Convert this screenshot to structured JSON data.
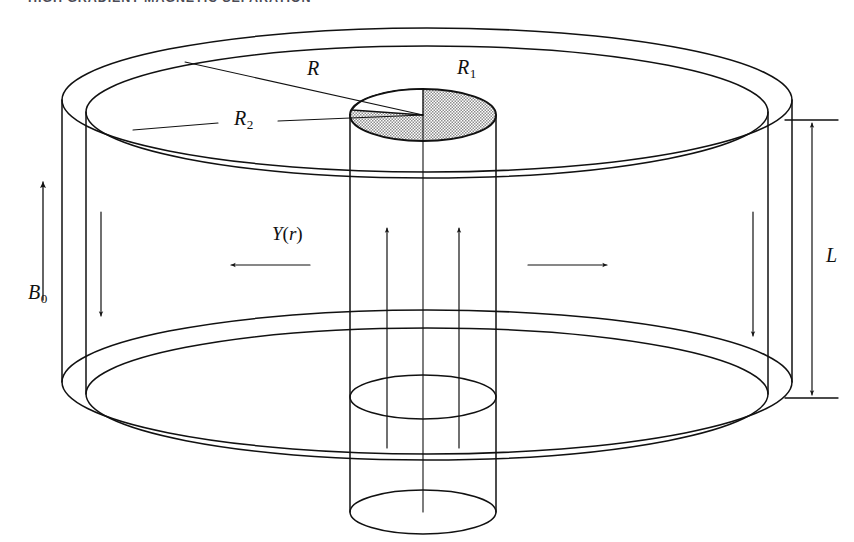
{
  "page": {
    "running_head": "HIGH GRADIENT MAGNETIC SEPARATION",
    "width": 854,
    "height": 542,
    "background": "#ffffff",
    "ink": "#111111",
    "shade_fill": "#c9c9c9"
  },
  "figure": {
    "name": "hgms-canister-cutaway",
    "labels": {
      "outer_radius": {
        "symbol": "R",
        "sub": ""
      },
      "tube_radius": {
        "symbol": "R",
        "sub": "1"
      },
      "inner_radius": {
        "symbol": "R",
        "sub": "2"
      },
      "field": {
        "symbol": "B",
        "sub": "0"
      },
      "yield_function": {
        "symbol": "Y",
        "arg": "(r)"
      },
      "length": {
        "symbol": "L",
        "sub": ""
      }
    },
    "arrows": [
      {
        "name": "field-arrow-B0",
        "direction": "up",
        "note": "applied field B0, outside canister at left"
      },
      {
        "name": "flow-arrow-left-wall",
        "direction": "down",
        "note": "downward flow in left annulus wall"
      },
      {
        "name": "flow-arrow-right-wall",
        "direction": "down",
        "note": "downward flow in right annulus wall"
      },
      {
        "name": "flow-arrow-tube-left",
        "direction": "up",
        "note": "upward flow inside inner tube"
      },
      {
        "name": "flow-arrow-tube-right",
        "direction": "up",
        "note": "upward flow inside inner tube"
      },
      {
        "name": "radial-arrow-left",
        "direction": "left",
        "note": "radial direction Y(r)"
      },
      {
        "name": "radial-arrow-right",
        "direction": "right",
        "note": "radial direction Y(r)"
      },
      {
        "name": "length-dimension-L",
        "direction": "both",
        "note": "overall cylinder length L"
      }
    ]
  }
}
